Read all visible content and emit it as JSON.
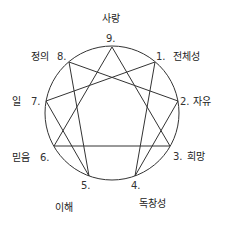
{
  "diagram": {
    "type": "enneagram",
    "circle": {
      "cx": 112,
      "cy": 113,
      "r": 67
    },
    "points": [
      {
        "num": "9.",
        "label": "사랑",
        "x": 112,
        "y": 47
      },
      {
        "num": "1.",
        "label": "전체성",
        "x": 155,
        "y": 62
      },
      {
        "num": "2.",
        "label": "자유",
        "x": 178,
        "y": 101
      },
      {
        "num": "3.",
        "label": "희망",
        "x": 170,
        "y": 146
      },
      {
        "num": "4.",
        "label": "독창성",
        "x": 135,
        "y": 176
      },
      {
        "num": "5.",
        "label": "이해",
        "x": 89,
        "y": 176
      },
      {
        "num": "6.",
        "label": "믿음",
        "x": 54,
        "y": 146
      },
      {
        "num": "7.",
        "label": "일",
        "x": 46,
        "y": 101
      },
      {
        "num": "8.",
        "label": "정의",
        "x": 69,
        "y": 62
      }
    ],
    "triangle": [
      "9",
      "3",
      "6"
    ],
    "hexad": [
      "1",
      "4",
      "2",
      "8",
      "5",
      "7"
    ]
  }
}
